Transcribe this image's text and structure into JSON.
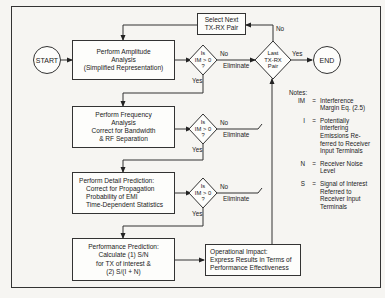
{
  "diagram": {
    "nodes": {
      "start": "START",
      "end": "END",
      "select_next": [
        "Select Next",
        "TX-RX Pair"
      ],
      "amplitude": [
        "Perform Amplitude",
        "Analysis",
        "(Simplified Representation)"
      ],
      "frequency": [
        "Perform Frequency",
        "Analysis",
        "Correct for Bandwidth",
        "& RF Separation"
      ],
      "detail": [
        "Perform Detail Prediction:",
        "Correct for Propagation",
        "Probability of EMI",
        "Time-Dependent Statistics"
      ],
      "performance": [
        "Performance Prediction:",
        "Calculate (1) S/N",
        "for TX of interest &",
        "(2) S/(I + N)"
      ],
      "operational": [
        "Operational Impact:",
        "Express Results in Terms of",
        "Performance Effectiveness"
      ],
      "decision": [
        "Is",
        "IM > 0",
        "?"
      ],
      "last_pair": [
        "Last",
        "TX-RX",
        "Pair"
      ]
    },
    "labels": {
      "yes": "Yes",
      "no": "No",
      "eliminate": "Eliminate"
    },
    "notes": {
      "title": "Notes:",
      "items": [
        {
          "key": "IM",
          "eq": "=",
          "lines": [
            "Interference",
            "Margin Eq. (2.5)"
          ]
        },
        {
          "key": "I",
          "eq": "=",
          "lines": [
            "Potentially",
            "Interfering",
            "Emissions Re-",
            "ferred to Receiver",
            "Input Terminals"
          ]
        },
        {
          "key": "N",
          "eq": "=",
          "lines": [
            "Receiver Noise",
            "Level"
          ]
        },
        {
          "key": "S",
          "eq": "=",
          "lines": [
            "Signal of Interest",
            "Referred to",
            "Receiver Input",
            "Terminals"
          ]
        }
      ]
    }
  }
}
